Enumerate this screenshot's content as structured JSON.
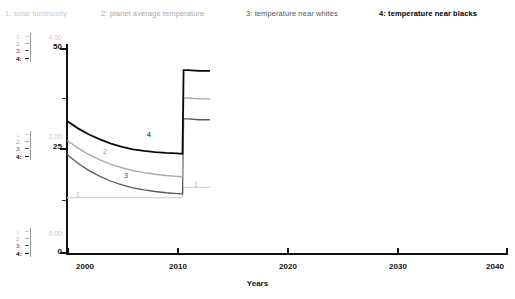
{
  "legend": {
    "items": [
      {
        "key": "1",
        "label": "1: solar luminosity",
        "color": "#c9c9c9"
      },
      {
        "key": "2",
        "label": "2: planet average temperature",
        "color": "#a8a8a8"
      },
      {
        "key": "3",
        "label": "3: temperature near whites",
        "color": "#555555"
      },
      {
        "key": "4",
        "label": "4: temperature near blacks",
        "color": "#000000"
      }
    ]
  },
  "axis_indicators": {
    "top": [
      {
        "label": "1:"
      },
      {
        "label": "2:"
      },
      {
        "label": "3:"
      },
      {
        "label": "4:"
      }
    ],
    "middle": [
      {
        "label": "1:"
      },
      {
        "label": "2:"
      },
      {
        "label": "3:"
      },
      {
        "label": "4:"
      }
    ],
    "bottom": [
      {
        "label": "1:"
      },
      {
        "label": "2:"
      },
      {
        "label": "3:"
      },
      {
        "label": "4:"
      }
    ]
  },
  "y_axis_secondary": {
    "top": "4.00",
    "middle": "2.00",
    "bottom": "0.00"
  },
  "y_axis_primary": {
    "top": "50",
    "middle": "25",
    "bottom": "0"
  },
  "x_axis": {
    "title": "Years",
    "ticks": [
      "2000",
      "2010",
      "2020",
      "2030",
      "2040"
    ]
  },
  "curve_labels": [
    {
      "key": "1",
      "text": "1"
    },
    {
      "key": "1b",
      "text": "1"
    },
    {
      "key": "2",
      "text": "2"
    },
    {
      "key": "3",
      "text": "3"
    },
    {
      "key": "4",
      "text": "4"
    }
  ],
  "chart_data": {
    "type": "line",
    "title": "",
    "xlabel": "Years",
    "ylabel": "",
    "xlim": [
      2000,
      2040
    ],
    "ylim": [
      0,
      50
    ],
    "ylim_secondary": [
      0.0,
      4.0
    ],
    "xticks": [
      2000,
      2010,
      2020,
      2030,
      2040
    ],
    "yticks": [
      0,
      25,
      50
    ],
    "yticks_secondary": [
      0.0,
      2.0,
      4.0
    ],
    "grid": false,
    "legend_position": "top",
    "series": [
      {
        "name": "solar luminosity",
        "key": "1",
        "color": "#c9c9c9",
        "axis": "secondary",
        "x": [
          2000.0,
          2001.0,
          2002.0,
          2003.0,
          2004.0,
          2005.0,
          2006.0,
          2007.0,
          2008.0,
          2009.0,
          2010.0,
          2010.5,
          2010.6,
          2011.0,
          2012.0,
          2013.0
        ],
        "values": [
          1.08,
          1.08,
          1.08,
          1.08,
          1.08,
          1.08,
          1.08,
          1.08,
          1.08,
          1.08,
          1.08,
          1.08,
          1.28,
          1.28,
          1.28,
          1.28
        ]
      },
      {
        "name": "planet average temperature",
        "key": "2",
        "color": "#a8a8a8",
        "axis": "primary",
        "x": [
          2000.0,
          2001.0,
          2002.0,
          2003.0,
          2004.0,
          2005.0,
          2006.0,
          2007.0,
          2008.0,
          2009.0,
          2010.0,
          2010.5,
          2010.6,
          2011.0,
          2012.0,
          2013.0
        ],
        "values": [
          27.5,
          25.6,
          24.0,
          22.7,
          21.6,
          20.8,
          20.1,
          19.6,
          19.2,
          18.9,
          18.7,
          18.6,
          37.8,
          37.8,
          37.6,
          37.6
        ]
      },
      {
        "name": "temperature near whites",
        "key": "3",
        "color": "#555555",
        "axis": "primary",
        "x": [
          2000.0,
          2001.0,
          2002.0,
          2003.0,
          2004.0,
          2005.0,
          2006.0,
          2007.0,
          2008.0,
          2009.0,
          2010.0,
          2010.5,
          2010.6,
          2011.0,
          2012.0,
          2013.0
        ],
        "values": [
          24.0,
          21.9,
          20.1,
          18.7,
          17.5,
          16.6,
          15.9,
          15.4,
          15.0,
          14.7,
          14.5,
          14.4,
          32.7,
          32.7,
          32.5,
          32.5
        ]
      },
      {
        "name": "temperature near blacks",
        "key": "4",
        "color": "#000000",
        "axis": "primary",
        "x": [
          2000.0,
          2001.0,
          2002.0,
          2003.0,
          2004.0,
          2005.0,
          2006.0,
          2007.0,
          2008.0,
          2009.0,
          2010.0,
          2010.5,
          2010.6,
          2011.0,
          2012.0,
          2013.0
        ],
        "values": [
          32.2,
          30.4,
          28.9,
          27.7,
          26.7,
          25.9,
          25.3,
          24.9,
          24.6,
          24.4,
          24.3,
          24.2,
          44.6,
          44.6,
          44.4,
          44.4
        ]
      }
    ]
  }
}
